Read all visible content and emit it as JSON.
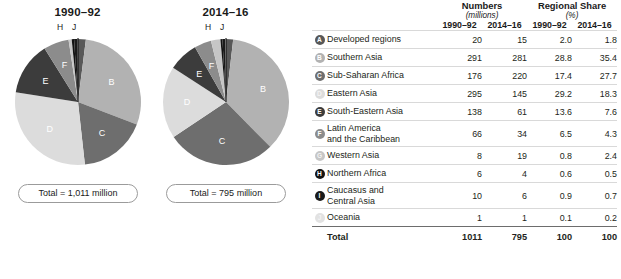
{
  "charts": [
    {
      "title": "1990–92",
      "total_label": "Total = 1,011 million",
      "year_key": "1990-92"
    },
    {
      "title": "2014–16",
      "total_label": "Total = 795 million",
      "year_key": "2014-16"
    }
  ],
  "leader_labels": {
    "h": "H",
    "j": "J"
  },
  "table": {
    "group_headers": [
      {
        "title": "Numbers",
        "subtitle": "(millions)"
      },
      {
        "title": "Regional Share",
        "subtitle": "(%)"
      }
    ],
    "year_headers": [
      "1990–92",
      "2014–16",
      "1990–92",
      "2014–16"
    ],
    "rows": [
      {
        "key": "A",
        "label": "Developed regions",
        "n1": "20",
        "n2": "15",
        "s1": "2.0",
        "s2": "1.8"
      },
      {
        "key": "B",
        "label": "Southern Asia",
        "n1": "291",
        "n2": "281",
        "s1": "28.8",
        "s2": "35.4"
      },
      {
        "key": "C",
        "label": "Sub-Saharan Africa",
        "n1": "176",
        "n2": "220",
        "s1": "17.4",
        "s2": "27.7"
      },
      {
        "key": "D",
        "label": "Eastern Asia",
        "n1": "295",
        "n2": "145",
        "s1": "29.2",
        "s2": "18.3"
      },
      {
        "key": "E",
        "label": "South-Eastern Asia",
        "n1": "138",
        "n2": "61",
        "s1": "13.6",
        "s2": "7.6"
      },
      {
        "key": "F",
        "label": "Latin America\nand the Caribbean",
        "n1": "66",
        "n2": "34",
        "s1": "6.5",
        "s2": "4.3"
      },
      {
        "key": "G",
        "label": "Western Asia",
        "n1": "8",
        "n2": "19",
        "s1": "0.8",
        "s2": "2.4"
      },
      {
        "key": "H",
        "label": "Northern Africa",
        "n1": "6",
        "n2": "4",
        "s1": "0.6",
        "s2": "0.5"
      },
      {
        "key": "I",
        "label": "Caucasus and\nCentral Asia",
        "n1": "10",
        "n2": "6",
        "s1": "0.9",
        "s2": "0.7"
      },
      {
        "key": "J",
        "label": "Oceania",
        "n1": "1",
        "n2": "1",
        "s1": "0.1",
        "s2": "0.2"
      }
    ],
    "total_row": {
      "label": "Total",
      "n1": "1011",
      "n2": "795",
      "s1": "100",
      "s2": "100"
    }
  },
  "colors": {
    "A": "#585858",
    "B": "#b2b2b2",
    "C": "#6e6e6e",
    "D": "#dcdcdc",
    "E": "#3c3c3c",
    "F": "#8c8c8c",
    "G": "#c6c6c6",
    "H": "#121212",
    "I": "#1a1a1a",
    "J": "#e2e2e2",
    "rule": "#d9d9d9",
    "text": "#231f20"
  },
  "chart_data": {
    "type": "pie",
    "legend_position": "right-table",
    "categories": [
      "Developed regions",
      "Southern Asia",
      "Sub-Saharan Africa",
      "Eastern Asia",
      "South-Eastern Asia",
      "Latin America and the Caribbean",
      "Western Asia",
      "Northern Africa",
      "Caucasus and Central Asia",
      "Oceania"
    ],
    "category_keys": [
      "A",
      "B",
      "C",
      "D",
      "E",
      "F",
      "G",
      "H",
      "I",
      "J"
    ],
    "series": [
      {
        "name": "1990–92",
        "unit": "millions",
        "values": [
          20,
          291,
          176,
          295,
          138,
          66,
          8,
          6,
          10,
          1
        ],
        "shares_pct": [
          2.0,
          28.8,
          17.4,
          29.2,
          13.6,
          6.5,
          0.8,
          0.6,
          0.9,
          0.1
        ],
        "total": 1011,
        "total_share_pct": 100
      },
      {
        "name": "2014–16",
        "unit": "millions",
        "values": [
          15,
          281,
          220,
          145,
          61,
          34,
          19,
          4,
          6,
          1
        ],
        "shares_pct": [
          1.8,
          35.4,
          27.7,
          18.3,
          7.6,
          4.3,
          2.4,
          0.5,
          0.7,
          0.2
        ],
        "total": 795,
        "total_share_pct": 100
      }
    ],
    "slice_order": [
      "A",
      "B",
      "C",
      "D",
      "E",
      "F",
      "G",
      "H",
      "I",
      "J"
    ],
    "start_angle_deg": 0,
    "direction": "clockwise"
  }
}
